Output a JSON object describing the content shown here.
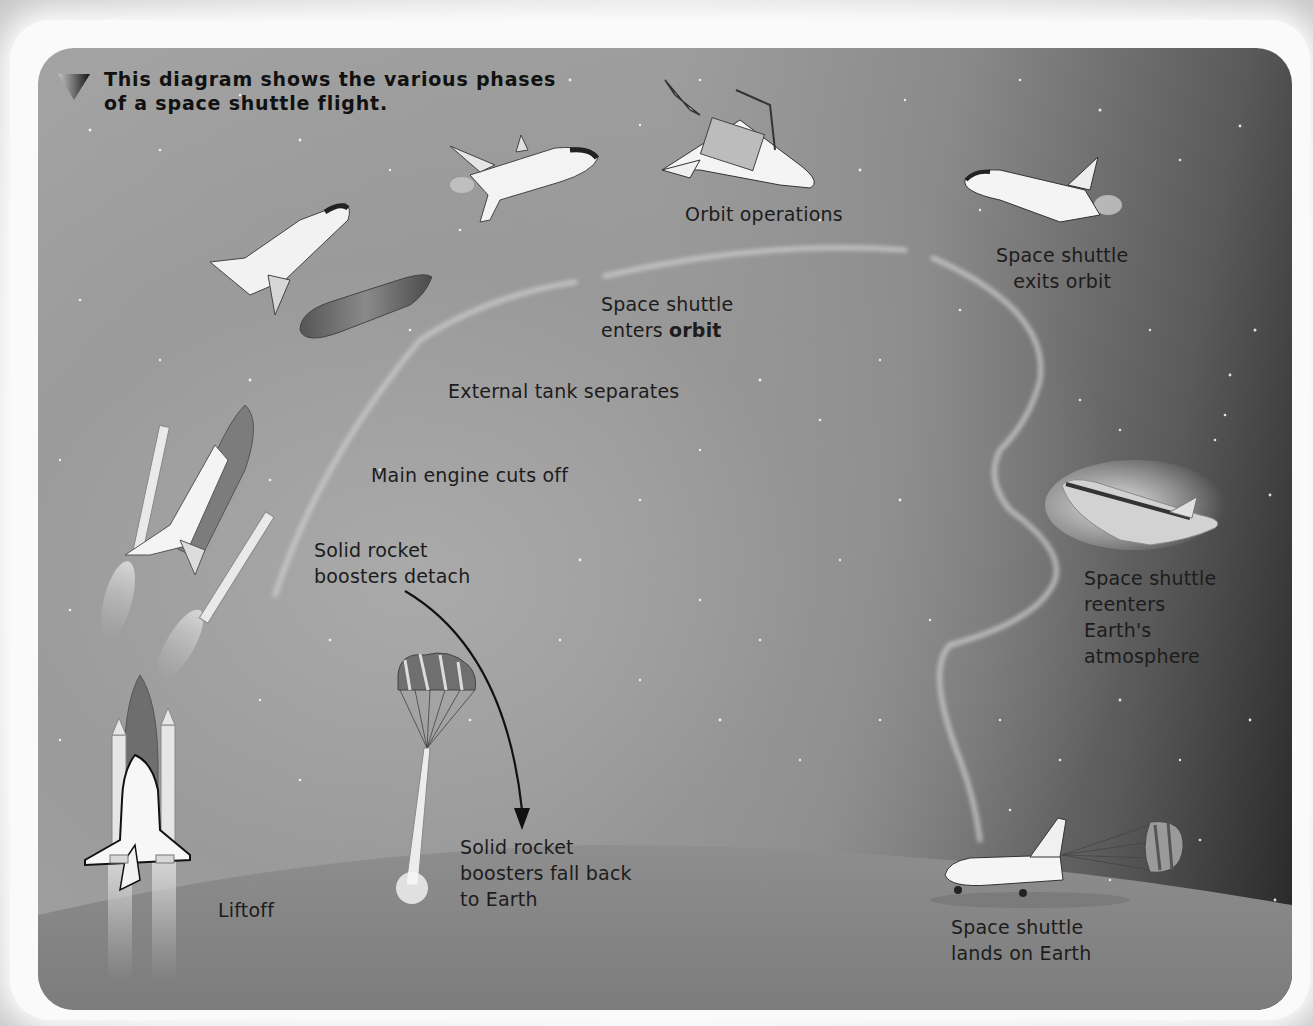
{
  "header": {
    "icon": "triangle-down-icon",
    "title_line1": "This diagram shows the various phases",
    "title_line2": "of a space shuttle flight."
  },
  "phases": [
    {
      "id": "liftoff",
      "label_lines": [
        "Liftoff"
      ]
    },
    {
      "id": "srb-detach",
      "label_lines": [
        "Solid rocket",
        "boosters detach"
      ]
    },
    {
      "id": "main-engine-cutoff",
      "label_lines": [
        "Main engine cuts off"
      ]
    },
    {
      "id": "external-tank-separates",
      "label_lines": [
        "External tank separates"
      ]
    },
    {
      "id": "enters-orbit",
      "label_lines": [
        "Space shuttle",
        "enters "
      ],
      "bold_word": "orbit"
    },
    {
      "id": "orbit-operations",
      "label_lines": [
        "Orbit operations"
      ]
    },
    {
      "id": "exits-orbit",
      "label_lines": [
        "Space shuttle",
        "exits orbit"
      ]
    },
    {
      "id": "reenters-atmosphere",
      "label_lines": [
        "Space shuttle",
        "reenters",
        "Earth's",
        "atmosphere"
      ]
    },
    {
      "id": "lands-on-earth",
      "label_lines": [
        "Space shuttle",
        "lands on Earth"
      ]
    },
    {
      "id": "srb-fall-back",
      "label_lines": [
        "Solid rocket",
        "boosters fall back",
        "to Earth"
      ]
    }
  ],
  "illustrations": [
    "shuttle-liftoff-stack",
    "shuttle-with-boosters-ascending",
    "shuttle-and-external-tank-separating",
    "shuttle-entering-orbit",
    "shuttle-orbit-operations-payload-bay-open",
    "shuttle-exiting-orbit",
    "shuttle-reentry-heat-glow",
    "shuttle-landing-with-drag-chute",
    "booster-with-parachutes-descending"
  ],
  "colors": {
    "text": "#1c1c1c",
    "trajectory": "#c8c8c8",
    "background_light": "#a3a3a3",
    "background_dark": "#262626",
    "earth": "#8c8c8c"
  }
}
